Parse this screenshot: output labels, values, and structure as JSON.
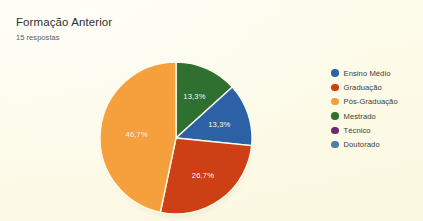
{
  "chart_data": {
    "type": "pie",
    "title": "Formação Anterior",
    "subtitle": "15 respostas",
    "responses": 15,
    "legend_position": "right",
    "grid": false,
    "categories": [
      "Ensino Médio",
      "Graduação",
      "Pós-Graduação",
      "Mestrado",
      "Técnico",
      "Doutorado"
    ],
    "values": [
      13.3,
      26.7,
      46.7,
      13.3,
      0,
      0
    ],
    "colors": [
      "#2d61a6",
      "#cd3f14",
      "#f5a03c",
      "#2f7030",
      "#6c2d6e",
      "#4b7fa8"
    ],
    "slices": [
      {
        "label": "Mestrado",
        "value": 13.3,
        "display": "13,3%",
        "color": "#2f7030",
        "start_deg": 0,
        "sweep_deg": 47.88,
        "label_x": 72,
        "label_y": 50
      },
      {
        "label": "Ensino Médio",
        "value": 13.3,
        "display": "13,3%",
        "color": "#2d61a6",
        "start_deg": 47.88,
        "sweep_deg": 47.88,
        "label_x": 72,
        "label_y": 92
      },
      {
        "label": "Graduação",
        "value": 26.7,
        "display": "26,7%",
        "color": "#cd3f14",
        "start_deg": 95.76,
        "sweep_deg": 96.12,
        "label_x": 24,
        "label_y": 116
      },
      {
        "label": "Pós-Graduação",
        "value": 46.7,
        "display": "46,7%",
        "color": "#f5a03c",
        "start_deg": 191.88,
        "sweep_deg": 168.12,
        "label_x": -37,
        "label_y": -3
      }
    ],
    "legend_entries": [
      {
        "label": "Ensino Médio",
        "color": "#2d61a6"
      },
      {
        "label": "Graduação",
        "color": "#cd3f14"
      },
      {
        "label": "Pós-Graduação",
        "color": "#f5a03c"
      },
      {
        "label": "Mestrado",
        "color": "#2f7030"
      },
      {
        "label": "Técnico",
        "color": "#6c2d6e"
      },
      {
        "label": "Doutorado",
        "color": "#4b7fa8"
      }
    ]
  },
  "theme": {
    "background": "#fdfbe9",
    "title_color": "#2f2f2f",
    "subtitle_color": "#5b5b5b",
    "label_color": "#ffffff"
  }
}
